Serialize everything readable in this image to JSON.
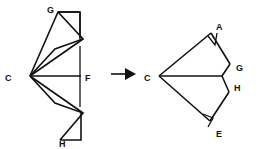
{
  "diagram": {
    "stroke_color": "#111111",
    "background_color": "#ffffff",
    "transform_arrow": {
      "icon": "right-arrow-icon",
      "label": ""
    },
    "left_figure": {
      "name": "fan-triangulated-polygon",
      "apex_label": "C",
      "labels": [
        {
          "id": "G",
          "text": "G",
          "x": 47,
          "y": 13
        },
        {
          "id": "C",
          "text": "C",
          "x": 5,
          "y": 81
        },
        {
          "id": "F",
          "text": "F",
          "x": 85,
          "y": 81
        },
        {
          "id": "H",
          "text": "H",
          "x": 59,
          "y": 144
        }
      ],
      "points": {
        "C": [
          30,
          76
        ],
        "F": [
          81,
          76
        ],
        "G": [
          58,
          12
        ],
        "G2": [
          80,
          12
        ],
        "P1": [
          82,
          38
        ],
        "P2": [
          78,
          45
        ],
        "P3": [
          81,
          109
        ],
        "P4": [
          78,
          102
        ],
        "H": [
          60,
          140
        ],
        "H2": [
          81,
          140
        ]
      }
    },
    "right_figure": {
      "name": "resulting-polygon",
      "apex_label": "C",
      "labels": [
        {
          "id": "A",
          "text": "A",
          "x": 218,
          "y": 29
        },
        {
          "id": "C",
          "text": "C",
          "x": 146,
          "y": 81
        },
        {
          "id": "G",
          "text": "G",
          "x": 235,
          "y": 70
        },
        {
          "id": "H",
          "text": "H",
          "x": 233,
          "y": 89
        },
        {
          "id": "E",
          "text": "E",
          "x": 217,
          "y": 136
        }
      ],
      "points": {
        "C": [
          159,
          76
        ],
        "A": [
          211,
          33
        ],
        "A2": [
          218,
          44
        ],
        "G": [
          230,
          64
        ],
        "H": [
          222,
          76
        ],
        "H2": [
          229,
          92
        ],
        "E": [
          210,
          121
        ],
        "E2": [
          201,
          116
        ]
      }
    }
  }
}
